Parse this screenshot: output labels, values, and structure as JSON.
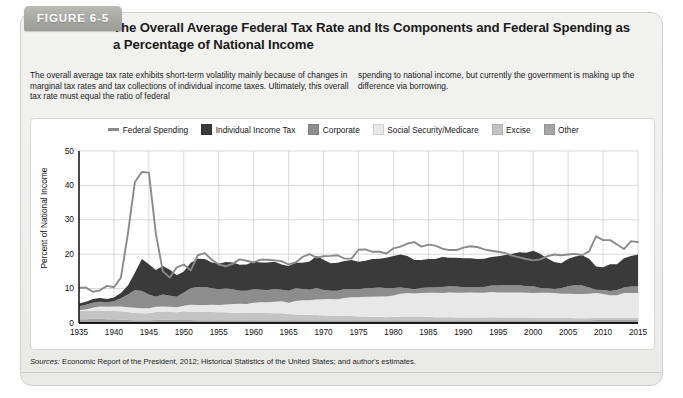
{
  "figure": {
    "tab_label": "FIGURE 6-5",
    "title": "The Overall Average Federal Tax Rate and Its Components and Federal Spending as a Percentage of National Income",
    "caption_left": "The overall average tax rate exhibits short-term volatility mainly because of changes in marginal tax rates and tax collections of individual income taxes. Ultimately, this overall tax rate must equal the ratio of federal",
    "caption_right": "spending to national income, but currently the government is making up the difference via borrowing.",
    "source_prefix": "Sources:",
    "source_text": " Economic Report of the President, 2012; Historical Statistics of the United States; and author's estimates."
  },
  "colors": {
    "federal_spending_line": "#8a8a8a",
    "individual_income_tax": "#3a3a3a",
    "corporate": "#8d8d8d",
    "social_security_medicare": "#e8e8e8",
    "excise": "#c4c4c4",
    "other": "#a5a5a5",
    "grid": "#c8c8c8",
    "axis": "#1a1a1a"
  },
  "chart_data": {
    "type": "area",
    "title": "The Overall Average Federal Tax Rate and Its Components and Federal Spending as a Percentage of National Income",
    "xlabel": "",
    "ylabel": "Percent of National Income",
    "xlim": [
      1935,
      2015
    ],
    "ylim": [
      0,
      50
    ],
    "ytick_values": [
      0,
      10,
      20,
      30,
      40,
      50
    ],
    "xtick_values": [
      1935,
      1940,
      1945,
      1950,
      1955,
      1960,
      1965,
      1970,
      1975,
      1980,
      1985,
      1990,
      1995,
      2000,
      2005,
      2010,
      2015
    ],
    "grid": true,
    "legend_position": "top-center",
    "stacked": true,
    "stack_order_bottom_to_top": [
      "Other",
      "Excise",
      "Social Security/Medicare",
      "Corporate",
      "Individual Income Tax"
    ],
    "legend": [
      {
        "label": "Federal Spending",
        "type": "line",
        "color": "#8a8a8a"
      },
      {
        "label": "Individual Income Tax",
        "type": "area",
        "color": "#3a3a3a"
      },
      {
        "label": "Corporate",
        "type": "area",
        "color": "#8d8d8d"
      },
      {
        "label": "Social Security/Medicare",
        "type": "area",
        "color": "#e8e8e8"
      },
      {
        "label": "Excise",
        "type": "area",
        "color": "#c4c4c4"
      },
      {
        "label": "Other",
        "type": "area",
        "color": "#a5a5a5"
      }
    ],
    "x": [
      1935,
      1936,
      1937,
      1938,
      1939,
      1940,
      1941,
      1942,
      1943,
      1944,
      1945,
      1946,
      1947,
      1948,
      1949,
      1950,
      1951,
      1952,
      1953,
      1954,
      1955,
      1956,
      1957,
      1958,
      1959,
      1960,
      1961,
      1962,
      1963,
      1964,
      1965,
      1966,
      1967,
      1968,
      1969,
      1970,
      1971,
      1972,
      1973,
      1974,
      1975,
      1976,
      1977,
      1978,
      1979,
      1980,
      1981,
      1982,
      1983,
      1984,
      1985,
      1986,
      1987,
      1988,
      1989,
      1990,
      1991,
      1992,
      1993,
      1994,
      1995,
      1996,
      1997,
      1998,
      1999,
      2000,
      2001,
      2002,
      2003,
      2004,
      2005,
      2006,
      2007,
      2008,
      2009,
      2010,
      2011,
      2012,
      2013,
      2014,
      2015
    ],
    "series": [
      {
        "name": "Other",
        "values": [
          1.1,
          1.1,
          1.2,
          1.2,
          1.1,
          1.1,
          1.0,
          0.9,
          0.8,
          0.8,
          0.8,
          0.9,
          1.0,
          1.0,
          0.9,
          0.9,
          0.9,
          0.8,
          0.8,
          0.8,
          0.8,
          0.8,
          0.8,
          0.8,
          0.8,
          0.8,
          0.8,
          0.8,
          0.8,
          0.8,
          0.8,
          0.8,
          0.8,
          0.8,
          0.8,
          0.8,
          0.8,
          0.8,
          0.8,
          0.8,
          0.8,
          0.8,
          0.8,
          0.8,
          0.8,
          0.8,
          0.8,
          0.8,
          0.8,
          0.8,
          0.8,
          0.8,
          0.8,
          0.8,
          0.8,
          0.8,
          0.8,
          0.8,
          0.8,
          0.8,
          0.8,
          0.8,
          0.8,
          0.8,
          0.8,
          0.8,
          0.8,
          0.8,
          0.8,
          0.8,
          0.8,
          0.8,
          0.8,
          0.8,
          0.9,
          0.9,
          0.9,
          0.9,
          0.9,
          0.9,
          0.9
        ]
      },
      {
        "name": "Excise",
        "values": [
          2.4,
          2.4,
          2.4,
          2.5,
          2.4,
          2.4,
          2.4,
          2.3,
          2.1,
          2.0,
          2.0,
          2.3,
          2.3,
          2.2,
          2.2,
          2.5,
          2.4,
          2.4,
          2.4,
          2.4,
          2.3,
          2.3,
          2.2,
          2.2,
          2.1,
          2.1,
          2.1,
          2.1,
          2.0,
          2.0,
          1.8,
          1.7,
          1.6,
          1.6,
          1.5,
          1.4,
          1.4,
          1.3,
          1.2,
          1.2,
          1.1,
          1.1,
          1.0,
          1.0,
          0.9,
          1.0,
          1.1,
          1.1,
          1.1,
          1.1,
          1.0,
          0.9,
          0.9,
          0.9,
          0.8,
          0.8,
          0.8,
          0.8,
          0.8,
          0.9,
          0.8,
          0.8,
          0.8,
          0.8,
          0.8,
          0.7,
          0.7,
          0.7,
          0.7,
          0.7,
          0.7,
          0.6,
          0.6,
          0.6,
          0.6,
          0.6,
          0.6,
          0.6,
          0.6,
          0.6,
          0.6
        ]
      },
      {
        "name": "Social Security/Medicare",
        "values": [
          0.2,
          0.4,
          0.8,
          1.1,
          1.2,
          1.3,
          1.4,
          1.4,
          1.5,
          1.5,
          1.5,
          1.5,
          1.5,
          1.5,
          1.5,
          1.6,
          2.0,
          2.0,
          2.0,
          2.1,
          2.1,
          2.3,
          2.5,
          2.6,
          2.6,
          3.0,
          3.1,
          3.1,
          3.4,
          3.5,
          3.3,
          3.9,
          4.2,
          4.2,
          4.5,
          4.7,
          4.8,
          4.8,
          5.3,
          5.5,
          5.6,
          5.7,
          5.8,
          5.9,
          6.0,
          6.2,
          6.6,
          6.8,
          6.7,
          6.8,
          7.0,
          7.1,
          7.0,
          7.2,
          7.2,
          7.2,
          7.3,
          7.2,
          7.2,
          7.3,
          7.3,
          7.3,
          7.3,
          7.3,
          7.2,
          7.2,
          7.3,
          7.3,
          7.2,
          7.0,
          7.0,
          7.0,
          7.0,
          7.1,
          7.2,
          6.9,
          6.6,
          6.6,
          7.2,
          7.2,
          7.2
        ]
      },
      {
        "name": "Corporate",
        "values": [
          1.2,
          1.4,
          1.5,
          1.4,
          1.3,
          1.5,
          2.4,
          3.7,
          5.2,
          5.0,
          4.0,
          2.9,
          3.5,
          3.2,
          3.0,
          3.9,
          4.8,
          5.3,
          5.3,
          4.8,
          4.6,
          4.6,
          4.3,
          3.8,
          3.9,
          3.9,
          3.7,
          3.6,
          3.6,
          3.4,
          3.5,
          3.7,
          3.3,
          3.1,
          3.4,
          2.7,
          2.4,
          2.5,
          2.6,
          2.4,
          2.3,
          2.5,
          2.6,
          2.6,
          2.4,
          2.2,
          1.8,
          1.4,
          1.2,
          1.5,
          1.5,
          1.5,
          1.8,
          1.8,
          1.8,
          1.6,
          1.6,
          1.6,
          1.7,
          1.9,
          2.0,
          2.1,
          2.1,
          2.1,
          1.9,
          2.0,
          1.4,
          1.3,
          1.2,
          1.6,
          2.2,
          2.6,
          2.5,
          1.8,
          1.0,
          1.2,
          1.2,
          1.5,
          1.6,
          1.9,
          1.9
        ]
      },
      {
        "name": "Individual Income Tax",
        "values": [
          0.8,
          0.9,
          1.1,
          1.1,
          1.0,
          1.1,
          1.5,
          2.6,
          5.0,
          9.3,
          8.8,
          7.8,
          8.3,
          7.6,
          6.3,
          6.1,
          7.4,
          8.2,
          8.1,
          7.5,
          7.4,
          7.7,
          7.8,
          7.5,
          7.6,
          8.0,
          7.9,
          8.0,
          8.0,
          7.3,
          7.2,
          7.4,
          7.6,
          8.2,
          9.3,
          8.8,
          8.0,
          8.1,
          8.1,
          8.4,
          8.0,
          8.0,
          8.4,
          8.4,
          8.9,
          9.3,
          9.6,
          9.4,
          8.5,
          8.1,
          8.3,
          8.3,
          8.7,
          8.3,
          8.4,
          8.4,
          8.3,
          8.2,
          8.2,
          8.3,
          8.5,
          8.8,
          9.1,
          9.6,
          9.7,
          10.3,
          9.9,
          8.7,
          7.8,
          7.3,
          7.9,
          8.3,
          8.8,
          8.4,
          6.7,
          6.6,
          7.8,
          7.5,
          8.5,
          8.9,
          9.3
        ]
      }
    ],
    "line_series": {
      "name": "Federal Spending",
      "values": [
        10.2,
        10.3,
        9.1,
        9.5,
        10.8,
        10.4,
        13.2,
        26.0,
        41.0,
        43.9,
        43.7,
        26.0,
        15.0,
        13.2,
        16.2,
        17.0,
        15.3,
        19.7,
        20.3,
        18.4,
        17.0,
        16.5,
        17.2,
        18.5,
        18.1,
        17.6,
        18.4,
        18.4,
        18.2,
        18.0,
        17.0,
        17.6,
        19.2,
        20.0,
        19.0,
        19.4,
        19.5,
        19.7,
        18.7,
        18.7,
        21.3,
        21.4,
        20.7,
        20.7,
        20.2,
        21.7,
        22.2,
        23.1,
        23.5,
        22.2,
        22.8,
        22.5,
        21.6,
        21.2,
        21.2,
        21.9,
        22.3,
        22.1,
        21.4,
        21.0,
        20.7,
        20.3,
        19.6,
        19.1,
        18.6,
        18.2,
        18.5,
        19.4,
        19.9,
        19.7,
        19.9,
        20.1,
        19.7,
        20.8,
        25.2,
        24.1,
        24.1,
        22.8,
        21.5,
        23.8,
        23.5
      ]
    }
  }
}
